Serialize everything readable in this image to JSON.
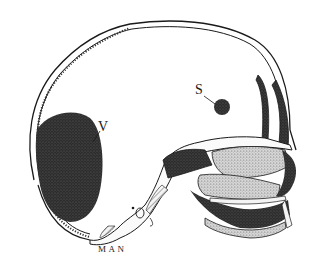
{
  "figure": {
    "caption": "MAN",
    "labels": {
      "ventricle_label": "V",
      "sinus_label": "S"
    },
    "colors": {
      "ink": "#1a1a1a",
      "stipple_dark": "#2b2b2b",
      "stipple_light": "#9a9a9a",
      "background": "#ffffff"
    }
  }
}
